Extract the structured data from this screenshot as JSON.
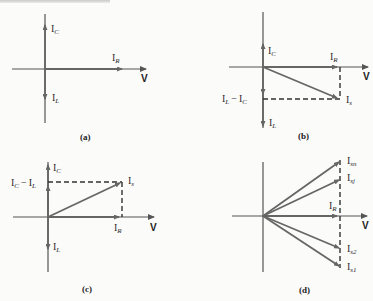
{
  "header_fragment": "… Circuits",
  "colors": {
    "axis": "#555555",
    "phasor": "#666666",
    "dashed": "#333333",
    "text": "#2a2a2a"
  },
  "panels": [
    {
      "id": "a",
      "caption": "(a)",
      "axis_label": "V",
      "phasors": [
        {
          "label": "I",
          "sub": "C",
          "direction": "up"
        },
        {
          "label": "I",
          "sub": "R",
          "direction": "right"
        },
        {
          "label": "I",
          "sub": "L",
          "direction": "down"
        }
      ]
    },
    {
      "id": "b",
      "caption": "(b)",
      "axis_label": "V",
      "phasors": [
        {
          "label": "I",
          "sub": "C",
          "direction": "up"
        },
        {
          "label": "I",
          "sub": "R",
          "direction": "right"
        },
        {
          "label": "I",
          "sub": "L",
          "direction": "down"
        },
        {
          "label": "I",
          "sub": "s",
          "direction": "down-right"
        }
      ],
      "difference_label": {
        "a": "I",
        "a_sub": "L",
        "op": "−",
        "b": "I",
        "b_sub": "C"
      }
    },
    {
      "id": "c",
      "caption": "(c)",
      "axis_label": "V",
      "phasors": [
        {
          "label": "I",
          "sub": "C",
          "direction": "up"
        },
        {
          "label": "I",
          "sub": "R",
          "direction": "right"
        },
        {
          "label": "I",
          "sub": "L",
          "direction": "down"
        },
        {
          "label": "I",
          "sub": "s",
          "direction": "up-right"
        }
      ],
      "difference_label": {
        "a": "I",
        "a_sub": "C",
        "op": "−",
        "b": "I",
        "b_sub": "L"
      }
    },
    {
      "id": "d",
      "caption": "(d)",
      "axis_label": "V",
      "phasors": [
        {
          "label": "I",
          "sub": "sn"
        },
        {
          "label": "I",
          "sub": "sj"
        },
        {
          "label": "I",
          "sub": "R"
        },
        {
          "label": "I",
          "sub": "s2"
        },
        {
          "label": "I",
          "sub": "s1"
        }
      ]
    }
  ]
}
